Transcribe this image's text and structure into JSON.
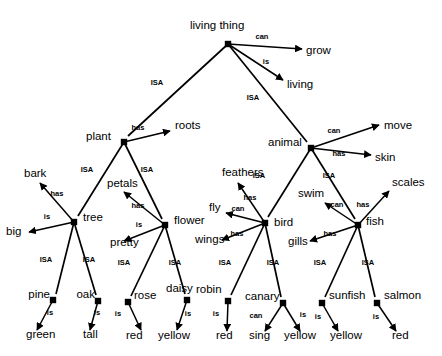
{
  "diagram": {
    "type": "semantic-network",
    "colors": {
      "stroke": "#000000",
      "background": "#ffffff",
      "node": "#000000"
    },
    "relations": {
      "isa": "ISA",
      "has": "has",
      "can": "can",
      "is": "is"
    },
    "concepts": [
      {
        "id": "living-thing",
        "label": "living thing",
        "x": 228,
        "y": 44,
        "label_x": 190,
        "label_y": 29,
        "anchor": "start"
      },
      {
        "id": "plant",
        "label": "plant",
        "x": 124,
        "y": 142,
        "label_x": 86,
        "label_y": 140,
        "anchor": "start"
      },
      {
        "id": "animal",
        "label": "animal",
        "x": 311,
        "y": 148,
        "label_x": 268,
        "label_y": 146,
        "anchor": "start"
      },
      {
        "id": "tree",
        "label": "tree",
        "x": 74,
        "y": 222,
        "label_x": 83,
        "label_y": 221,
        "anchor": "start"
      },
      {
        "id": "flower",
        "label": "flower",
        "x": 165,
        "y": 225,
        "label_x": 174,
        "label_y": 224,
        "anchor": "start"
      },
      {
        "id": "bird",
        "label": "bird",
        "x": 265,
        "y": 223,
        "label_x": 274,
        "label_y": 226,
        "anchor": "start"
      },
      {
        "id": "fish",
        "label": "fish",
        "x": 358,
        "y": 225,
        "label_x": 366,
        "label_y": 225,
        "anchor": "start"
      },
      {
        "id": "pine",
        "label": "pine",
        "x": 53,
        "y": 300,
        "label_x": 50,
        "label_y": 298,
        "anchor": "end"
      },
      {
        "id": "oak",
        "label": "oak",
        "x": 98,
        "y": 301,
        "label_x": 95,
        "label_y": 298,
        "anchor": "end"
      },
      {
        "id": "rose",
        "label": "rose",
        "x": 128,
        "y": 302,
        "label_x": 134,
        "label_y": 299,
        "anchor": "start"
      },
      {
        "id": "daisy",
        "label": "daisy",
        "x": 187,
        "y": 300,
        "label_x": 166,
        "label_y": 292,
        "anchor": "start"
      },
      {
        "id": "robin",
        "label": "robin",
        "x": 228,
        "y": 301,
        "label_x": 196,
        "label_y": 293,
        "anchor": "start"
      },
      {
        "id": "canary",
        "label": "canary",
        "x": 283,
        "y": 303,
        "label_x": 245,
        "label_y": 300,
        "anchor": "start"
      },
      {
        "id": "sunfish",
        "label": "sunfish",
        "x": 322,
        "y": 303,
        "label_x": 329,
        "label_y": 299,
        "anchor": "start"
      },
      {
        "id": "salmon",
        "label": "salmon",
        "x": 377,
        "y": 303,
        "label_x": 384,
        "label_y": 299,
        "anchor": "start"
      }
    ],
    "properties": [
      {
        "id": "grow",
        "label": "grow",
        "x": 306,
        "y": 54,
        "anchor": "start"
      },
      {
        "id": "living",
        "label": "living",
        "x": 287,
        "y": 88,
        "anchor": "start"
      },
      {
        "id": "roots",
        "label": "roots",
        "x": 175,
        "y": 129,
        "anchor": "start"
      },
      {
        "id": "move",
        "label": "move",
        "x": 384,
        "y": 129,
        "anchor": "start"
      },
      {
        "id": "skin",
        "label": "skin",
        "x": 375,
        "y": 161,
        "anchor": "start"
      },
      {
        "id": "scales",
        "label": "scales",
        "x": 392,
        "y": 186,
        "anchor": "start"
      },
      {
        "id": "bark",
        "label": "bark",
        "x": 24,
        "y": 177,
        "anchor": "start"
      },
      {
        "id": "petals",
        "label": "petals",
        "x": 107,
        "y": 187,
        "anchor": "start"
      },
      {
        "id": "feathers",
        "label": "feathers",
        "x": 222,
        "y": 176,
        "anchor": "start"
      },
      {
        "id": "swim",
        "label": "swim",
        "x": 298,
        "y": 197,
        "anchor": "start"
      },
      {
        "id": "big",
        "label": "big",
        "x": 6,
        "y": 235,
        "anchor": "start"
      },
      {
        "id": "fly",
        "label": "fly",
        "x": 209,
        "y": 211,
        "anchor": "start"
      },
      {
        "id": "pretty",
        "label": "pretty",
        "x": 110,
        "y": 246,
        "anchor": "start"
      },
      {
        "id": "wings",
        "label": "wings",
        "x": 195,
        "y": 243,
        "anchor": "start"
      },
      {
        "id": "gills",
        "label": "gills",
        "x": 288,
        "y": 245,
        "anchor": "start"
      },
      {
        "id": "green",
        "label": "green",
        "x": 26,
        "y": 338,
        "anchor": "start"
      },
      {
        "id": "tall",
        "label": "tall",
        "x": 83,
        "y": 338,
        "anchor": "start"
      },
      {
        "id": "red-rose",
        "label": "red",
        "x": 126,
        "y": 339,
        "anchor": "start"
      },
      {
        "id": "yellow-daisy",
        "label": "yellow",
        "x": 158,
        "y": 339,
        "anchor": "start"
      },
      {
        "id": "red-robin",
        "label": "red",
        "x": 216,
        "y": 339,
        "anchor": "start"
      },
      {
        "id": "sing",
        "label": "sing",
        "x": 249,
        "y": 339,
        "anchor": "start"
      },
      {
        "id": "yellow-canary",
        "label": "yellow",
        "x": 284,
        "y": 339,
        "anchor": "start"
      },
      {
        "id": "yellow-sunfish",
        "label": "yellow",
        "x": 330,
        "y": 339,
        "anchor": "start"
      },
      {
        "id": "red-salmon",
        "label": "red",
        "x": 392,
        "y": 339,
        "anchor": "start"
      }
    ],
    "links": [
      {
        "id": "living-thing-can-grow",
        "from": "living thing",
        "to": "grow",
        "relation": "can",
        "x1": 228,
        "y1": 44,
        "x2": 302,
        "y2": 49,
        "lx": 262,
        "ly": 39
      },
      {
        "id": "living-thing-is-living",
        "from": "living thing",
        "to": "living",
        "relation": "is",
        "x1": 228,
        "y1": 44,
        "x2": 283,
        "y2": 80,
        "lx": 266,
        "ly": 64
      },
      {
        "id": "plant-isa-living-thing",
        "from": "plant",
        "to": "living thing",
        "relation": "ISA",
        "x1": 228,
        "y1": 44,
        "x2": 128,
        "y2": 136,
        "lx": 157,
        "ly": 85
      },
      {
        "id": "animal-isa-living-thing",
        "from": "animal",
        "to": "living thing",
        "relation": "ISA",
        "x1": 228,
        "y1": 44,
        "x2": 307,
        "y2": 142,
        "lx": 253,
        "ly": 100
      },
      {
        "id": "plant-has-roots",
        "from": "plant",
        "to": "roots",
        "relation": "has",
        "x1": 124,
        "y1": 142,
        "x2": 170,
        "y2": 131,
        "lx": 138,
        "ly": 130
      },
      {
        "id": "tree-isa-plant",
        "from": "tree",
        "to": "plant",
        "relation": "ISA",
        "x1": 124,
        "y1": 142,
        "x2": 78,
        "y2": 216,
        "lx": 87,
        "ly": 172
      },
      {
        "id": "flower-isa-plant",
        "from": "flower",
        "to": "plant",
        "relation": "ISA",
        "x1": 124,
        "y1": 142,
        "x2": 162,
        "y2": 219,
        "lx": 147,
        "ly": 172
      },
      {
        "id": "animal-can-move",
        "from": "animal",
        "to": "move",
        "relation": "can",
        "x1": 311,
        "y1": 148,
        "x2": 379,
        "y2": 125,
        "lx": 334,
        "ly": 133
      },
      {
        "id": "animal-has-skin",
        "from": "animal",
        "to": "skin",
        "relation": "has",
        "x1": 311,
        "y1": 148,
        "x2": 371,
        "y2": 155,
        "lx": 339,
        "ly": 156
      },
      {
        "id": "bird-isa-animal",
        "from": "bird",
        "to": "animal",
        "relation": "ISA",
        "x1": 311,
        "y1": 148,
        "x2": 268,
        "y2": 217,
        "lx": 259,
        "ly": 178
      },
      {
        "id": "fish-isa-animal",
        "from": "fish",
        "to": "animal",
        "relation": "ISA",
        "x1": 311,
        "y1": 148,
        "x2": 355,
        "y2": 219,
        "lx": 329,
        "ly": 178
      },
      {
        "id": "tree-has-bark",
        "from": "tree",
        "to": "bark",
        "relation": "has",
        "x1": 74,
        "y1": 222,
        "x2": 40,
        "y2": 183,
        "lx": 57,
        "ly": 196
      },
      {
        "id": "tree-is-big",
        "from": "tree",
        "to": "big",
        "relation": "is",
        "x1": 74,
        "y1": 222,
        "x2": 29,
        "y2": 232,
        "lx": 47,
        "ly": 219
      },
      {
        "id": "pine-isa-tree",
        "from": "pine",
        "to": "tree",
        "relation": "ISA",
        "x1": 74,
        "y1": 222,
        "x2": 56,
        "y2": 294,
        "lx": 46,
        "ly": 262
      },
      {
        "id": "oak-isa-tree",
        "from": "oak",
        "to": "tree",
        "relation": "ISA",
        "x1": 74,
        "y1": 222,
        "x2": 96,
        "y2": 295,
        "lx": 89,
        "ly": 262
      },
      {
        "id": "flower-has-petals",
        "from": "flower",
        "to": "petals",
        "relation": "has",
        "x1": 165,
        "y1": 225,
        "x2": 124,
        "y2": 192,
        "lx": 138,
        "ly": 208
      },
      {
        "id": "flower-is-pretty",
        "from": "flower",
        "to": "pretty",
        "relation": "is",
        "x1": 165,
        "y1": 225,
        "x2": 124,
        "y2": 241,
        "lx": 139,
        "ly": 227
      },
      {
        "id": "rose-isa-flower",
        "from": "rose",
        "to": "flower",
        "relation": "ISA",
        "x1": 165,
        "y1": 225,
        "x2": 131,
        "y2": 296,
        "lx": 124,
        "ly": 265
      },
      {
        "id": "daisy-isa-flower",
        "from": "daisy",
        "to": "flower",
        "relation": "ISA",
        "x1": 165,
        "y1": 225,
        "x2": 185,
        "y2": 294,
        "lx": 175,
        "ly": 265
      },
      {
        "id": "bird-has-feathers",
        "from": "bird",
        "to": "feathers",
        "relation": "has",
        "x1": 265,
        "y1": 223,
        "x2": 238,
        "y2": 183,
        "lx": 250,
        "ly": 200
      },
      {
        "id": "bird-can-fly",
        "from": "bird",
        "to": "fly",
        "relation": "can",
        "x1": 265,
        "y1": 223,
        "x2": 226,
        "y2": 213,
        "lx": 238,
        "ly": 211
      },
      {
        "id": "bird-has-wings",
        "from": "bird",
        "to": "wings",
        "relation": "has",
        "x1": 265,
        "y1": 223,
        "x2": 222,
        "y2": 240,
        "lx": 237,
        "ly": 236
      },
      {
        "id": "robin-isa-bird",
        "from": "robin",
        "to": "bird",
        "relation": "ISA",
        "x1": 265,
        "y1": 223,
        "x2": 231,
        "y2": 295,
        "lx": 225,
        "ly": 265
      },
      {
        "id": "canary-isa-bird",
        "from": "canary",
        "to": "bird",
        "relation": "ISA",
        "x1": 265,
        "y1": 223,
        "x2": 281,
        "y2": 297,
        "lx": 273,
        "ly": 265
      },
      {
        "id": "fish-has-scales",
        "from": "fish",
        "to": "scales",
        "relation": "has",
        "x1": 358,
        "y1": 225,
        "x2": 389,
        "y2": 191,
        "lx": 363,
        "ly": 207
      },
      {
        "id": "fish-can-swim",
        "from": "fish",
        "to": "swim",
        "relation": "can",
        "x1": 358,
        "y1": 225,
        "x2": 325,
        "y2": 203,
        "lx": 337,
        "ly": 207
      },
      {
        "id": "fish-has-gills",
        "from": "fish",
        "to": "gills",
        "relation": "has",
        "x1": 358,
        "y1": 225,
        "x2": 310,
        "y2": 241,
        "lx": 330,
        "ly": 236
      },
      {
        "id": "sunfish-isa-fish",
        "from": "sunfish",
        "to": "fish",
        "relation": "ISA",
        "x1": 358,
        "y1": 225,
        "x2": 325,
        "y2": 297,
        "lx": 320,
        "ly": 265
      },
      {
        "id": "salmon-isa-fish",
        "from": "salmon",
        "to": "fish",
        "relation": "ISA",
        "x1": 358,
        "y1": 225,
        "x2": 375,
        "y2": 297,
        "lx": 368,
        "ly": 265
      },
      {
        "id": "pine-is-green",
        "from": "pine",
        "to": "green",
        "relation": "is",
        "x1": 53,
        "y1": 300,
        "x2": 37,
        "y2": 330,
        "lx": 50,
        "ly": 315
      },
      {
        "id": "oak-is-tall",
        "from": "oak",
        "to": "tall",
        "relation": "is",
        "x1": 98,
        "y1": 301,
        "x2": 90,
        "y2": 330,
        "lx": 97,
        "ly": 315
      },
      {
        "id": "rose-is-red",
        "from": "rose",
        "to": "red",
        "relation": "is",
        "x1": 128,
        "y1": 302,
        "x2": 141,
        "y2": 330,
        "lx": 118,
        "ly": 316
      },
      {
        "id": "daisy-is-yellow",
        "from": "daisy",
        "to": "yellow",
        "relation": "is",
        "x1": 187,
        "y1": 300,
        "x2": 177,
        "y2": 330,
        "lx": 188,
        "ly": 316
      },
      {
        "id": "robin-is-red",
        "from": "robin",
        "to": "red",
        "relation": "is",
        "x1": 228,
        "y1": 301,
        "x2": 227,
        "y2": 331,
        "lx": 216,
        "ly": 316
      },
      {
        "id": "canary-can-sing",
        "from": "canary",
        "to": "sing",
        "relation": "can",
        "x1": 283,
        "y1": 303,
        "x2": 265,
        "y2": 331,
        "lx": 256,
        "ly": 318
      },
      {
        "id": "canary-is-yellow",
        "from": "canary",
        "to": "yellow",
        "relation": "is",
        "x1": 283,
        "y1": 303,
        "x2": 300,
        "y2": 331,
        "lx": 303,
        "ly": 317
      },
      {
        "id": "sunfish-is-yellow",
        "from": "sunfish",
        "to": "yellow",
        "relation": "is",
        "x1": 322,
        "y1": 303,
        "x2": 338,
        "y2": 331,
        "lx": 318,
        "ly": 319
      },
      {
        "id": "salmon-is-red",
        "from": "salmon",
        "to": "red",
        "relation": "is",
        "x1": 377,
        "y1": 303,
        "x2": 396,
        "y2": 331,
        "lx": 376,
        "ly": 319
      }
    ]
  }
}
